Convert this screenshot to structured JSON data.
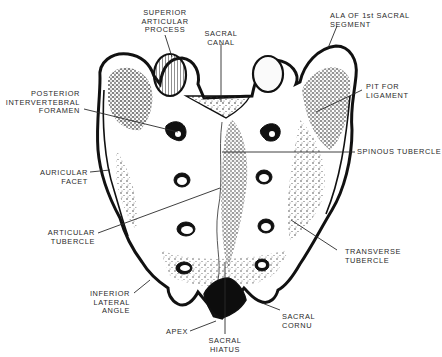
{
  "figure": {
    "colors": {
      "ink": "#111111",
      "paper": "#ffffff",
      "label": "#2a2a2a"
    }
  },
  "labels": {
    "superior_articular_process": "SUPERIOR\nARTICULAR\nPROCESS",
    "sacral_canal": "SACRAL\nCANAL",
    "ala_of_1st_sacral_segment": "ALA OF 1st SACRAL\nSEGMENT",
    "posterior_intervertebral_foramen": "POSTERIOR\nINTERVERTEBRAL\nFORAMEN",
    "pit_for_ligament": "PIT FOR\nLIGAMENT",
    "spinous_tubercle": "SPINOUS TUBERCLE",
    "auricular_facet": "AURICULAR\nFACET",
    "articular_tubercle": "ARTICULAR\nTUBERCLE",
    "transverse_tubercle": "TRANSVERSE\nTUBERCLE",
    "inferior_lateral_angle": "INFERIOR\nLATERAL\nANGLE",
    "sacral_cornu": "SACRAL\nCORNU",
    "apex": "APEX",
    "sacral_hiatus": "SACRAL\nHIATUS"
  }
}
